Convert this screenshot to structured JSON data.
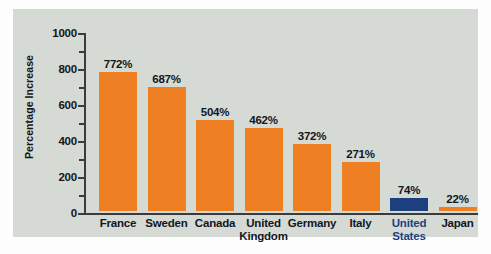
{
  "chart_data": {
    "type": "bar",
    "title": "",
    "xlabel": "",
    "ylabel": "Percentage Increase",
    "ylim": [
      0,
      1000
    ],
    "ytick_labels": [
      "1000",
      "800",
      "600",
      "400",
      "200",
      "0"
    ],
    "ytick_values": [
      1000,
      800,
      600,
      400,
      200,
      0
    ],
    "minor_tick_interval": 100,
    "grid": false,
    "legend": "none",
    "value_suffix": "%",
    "categories": [
      "France",
      "Sweden",
      "Canada",
      "United Kingdom",
      "Germany",
      "Italy",
      "United States",
      "Japan"
    ],
    "values": [
      772,
      687,
      504,
      462,
      372,
      271,
      74,
      22
    ],
    "value_labels": [
      "772%",
      "687%",
      "504%",
      "462%",
      "372%",
      "271%",
      "74%",
      "22%"
    ],
    "bars": [
      {
        "category": "France",
        "label_lines": [
          "France"
        ],
        "value": 772,
        "value_label": "772%",
        "color": "#ee7f22",
        "highlight": false
      },
      {
        "category": "Sweden",
        "label_lines": [
          "Sweden"
        ],
        "value": 687,
        "value_label": "687%",
        "color": "#ee7f22",
        "highlight": false
      },
      {
        "category": "Canada",
        "label_lines": [
          "Canada"
        ],
        "value": 504,
        "value_label": "504%",
        "color": "#ee7f22",
        "highlight": false
      },
      {
        "category": "United Kingdom",
        "label_lines": [
          "United",
          "Kingdom"
        ],
        "value": 462,
        "value_label": "462%",
        "color": "#ee7f22",
        "highlight": false
      },
      {
        "category": "Germany",
        "label_lines": [
          "Germany"
        ],
        "value": 372,
        "value_label": "372%",
        "color": "#ee7f22",
        "highlight": false
      },
      {
        "category": "Italy",
        "label_lines": [
          "Italy"
        ],
        "value": 271,
        "value_label": "271%",
        "color": "#ee7f22",
        "highlight": false
      },
      {
        "category": "United States",
        "label_lines": [
          "United",
          "States"
        ],
        "value": 74,
        "value_label": "74%",
        "color": "#1c3f80",
        "highlight": true
      },
      {
        "category": "Japan",
        "label_lines": [
          "Japan"
        ],
        "value": 22,
        "value_label": "22%",
        "color": "#ee7f22",
        "highlight": false
      }
    ]
  },
  "colors": {
    "bar_default": "#ee7f22",
    "bar_highlight": "#1c3f80",
    "panel_background": "#d5dad4",
    "page_background": "#fdfdfd",
    "axis": "#3b3b3b",
    "text": "#12161f"
  }
}
